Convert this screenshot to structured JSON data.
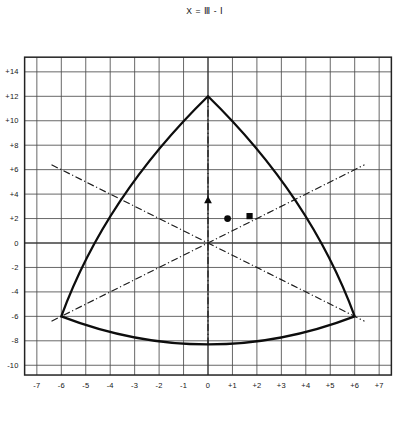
{
  "chart_data": {
    "type": "line",
    "title": "X = Ⅲ - Ⅰ",
    "subtitle": "",
    "xlabel": "X = Ⅲ - Ⅰ",
    "ylabel": "Y = 2×Ⅱ - (Ⅰ + Ⅲ)",
    "xlim": [
      -7.5,
      7.5
    ],
    "ylim": [
      -10.8,
      15.2
    ],
    "xticks": [
      -7,
      -6,
      -5,
      -4,
      -3,
      -2,
      -1,
      0,
      1,
      2,
      3,
      4,
      5,
      6,
      7
    ],
    "xtick_labels": [
      "-7",
      "-6",
      "-5",
      "-4",
      "-3",
      "-2",
      "-1",
      "0",
      "+1",
      "+2",
      "+3",
      "+4",
      "+5",
      "+6",
      "+7"
    ],
    "yticks": [
      14,
      12,
      10,
      8,
      6,
      4,
      2,
      0,
      -2,
      -4,
      -6,
      -8,
      -10
    ],
    "ytick_labels": [
      "+14",
      "+12",
      "+10",
      "+8",
      "+6",
      "+4",
      "+2",
      "0",
      "-2",
      "-4",
      "-6",
      "-8",
      "-10"
    ],
    "grid": true,
    "grid_step_x": 1,
    "grid_step_y": 2,
    "legend": "none",
    "series": [
      {
        "name": "boundary-curve",
        "type": "closed-curve",
        "style": "solid",
        "vertices": [
          {
            "x": 0,
            "y": 12
          },
          {
            "x": -6,
            "y": -6
          },
          {
            "x": 6,
            "y": -6
          }
        ],
        "arc_sag": [
          {
            "name": "left-arc",
            "mid_x": -3.6,
            "mid_y": 3.4
          },
          {
            "name": "right-arc",
            "mid_x": 3.6,
            "mid_y": 3.4
          },
          {
            "name": "bottom-arc",
            "mid_x": 0,
            "mid_y": -8.3
          }
        ]
      },
      {
        "name": "construction-line-top-vertex",
        "type": "line",
        "style": "dash-dot",
        "points": [
          {
            "x": -6.4,
            "y": -6.4
          },
          {
            "x": 6.4,
            "y": 6.4
          }
        ]
      },
      {
        "name": "construction-line-left-vertex",
        "type": "line",
        "style": "dash-dot",
        "points": [
          {
            "x": -6.4,
            "y": 6.4
          },
          {
            "x": 6.4,
            "y": -6.4
          }
        ]
      },
      {
        "name": "construction-line-vertical",
        "type": "line",
        "style": "dash-dot",
        "points": [
          {
            "x": 0,
            "y": 12
          },
          {
            "x": 0,
            "y": -8.4
          }
        ]
      }
    ],
    "markers": [
      {
        "name": "triangle-point",
        "shape": "triangle",
        "x": 0.0,
        "y": 3.5
      },
      {
        "name": "circle-point",
        "shape": "circle",
        "x": 0.8,
        "y": 2.0
      },
      {
        "name": "square-point",
        "shape": "square",
        "x": 1.7,
        "y": 2.2
      }
    ]
  }
}
